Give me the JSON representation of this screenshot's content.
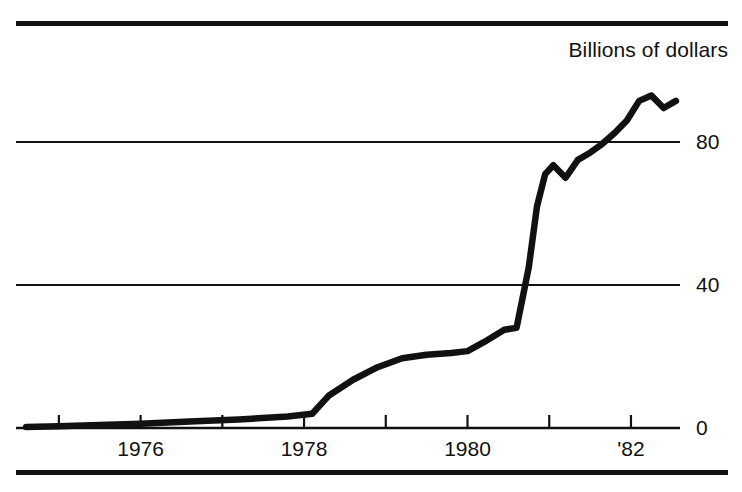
{
  "chart_data": {
    "type": "line",
    "title": "",
    "subtitle": "",
    "units_caption": "Billions of dollars",
    "xlabel": "",
    "ylabel": "Billions of dollars",
    "ylim": [
      0,
      100
    ],
    "xlim": [
      1974.5,
      1982.6
    ],
    "grid": true,
    "gridlines_y": [
      0,
      40,
      80
    ],
    "legend": null,
    "legend_position": "none",
    "y_ticks": [
      {
        "value": 0,
        "label": "0"
      },
      {
        "value": 40,
        "label": "40"
      },
      {
        "value": 80,
        "label": "80"
      }
    ],
    "x_ticks": [
      {
        "value": 1975,
        "label": ""
      },
      {
        "value": 1976,
        "label": "1976"
      },
      {
        "value": 1977,
        "label": ""
      },
      {
        "value": 1978,
        "label": "1978"
      },
      {
        "value": 1979,
        "label": ""
      },
      {
        "value": 1980,
        "label": "1980"
      },
      {
        "value": 1981,
        "label": ""
      },
      {
        "value": 1982,
        "label": "'82"
      }
    ],
    "series": [
      {
        "name": "series-1",
        "color": "#111111",
        "x": [
          1974.6,
          1975.0,
          1975.4,
          1976.0,
          1976.6,
          1977.2,
          1977.8,
          1978.1,
          1978.3,
          1978.6,
          1978.9,
          1979.2,
          1979.5,
          1979.8,
          1980.0,
          1980.2,
          1980.45,
          1980.6,
          1980.75,
          1980.85,
          1980.95,
          1981.05,
          1981.2,
          1981.35,
          1981.5,
          1981.65,
          1981.8,
          1981.95,
          1982.1,
          1982.25,
          1982.4,
          1982.55
        ],
        "y": [
          0.3,
          0.5,
          0.8,
          1.2,
          1.8,
          2.4,
          3.2,
          4.0,
          9.0,
          13.5,
          17.0,
          19.5,
          20.5,
          21.0,
          21.5,
          24.0,
          27.5,
          28.0,
          45.0,
          62.0,
          71.0,
          73.5,
          70.0,
          75.0,
          77.0,
          79.5,
          82.5,
          86.0,
          91.5,
          93.0,
          89.5,
          91.5
        ]
      }
    ]
  }
}
